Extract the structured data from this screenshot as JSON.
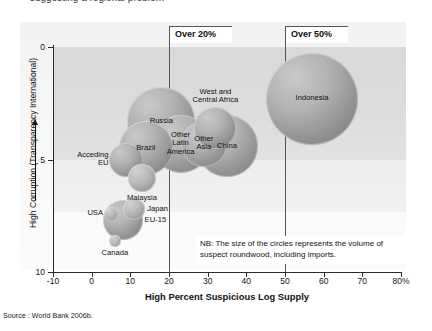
{
  "figure": {
    "source_note": "Source : World Bank 2006b.",
    "nb_note": "NB: The size of the circles represents the volume of suspect roundwood, including imports.",
    "clipped_top_text": "suggesting a regional problem"
  },
  "chart_data": {
    "type": "scatter",
    "title": "",
    "xlabel": "High Percent Suspicious Log Supply",
    "ylabel": "High Corruption (Transparency International)",
    "xlim": [
      -10,
      80
    ],
    "ylim": [
      0,
      10
    ],
    "y_inverted": true,
    "xticks": [
      "-10",
      "0",
      "10",
      "20",
      "30",
      "40",
      "50",
      "60",
      "70",
      "80%"
    ],
    "xtick_values": [
      -10,
      0,
      10,
      20,
      30,
      40,
      50,
      60,
      70,
      80
    ],
    "yticks": [
      "0",
      "5",
      "10"
    ],
    "ytick_values": [
      0,
      5,
      10
    ],
    "grid": false,
    "legend": "none",
    "size_meaning": "volume of suspect roundwood, including imports",
    "annotations": [
      {
        "label": "Over 20%",
        "x": 20
      },
      {
        "label": "Over 50%",
        "x": 50
      }
    ],
    "points": [
      {
        "name": "Indonesia",
        "x": 57,
        "y": 2.3,
        "size": 46,
        "label_pos": "in"
      },
      {
        "name": "West and\nCentral Africa",
        "x": 32,
        "y": 3.6,
        "size": 21,
        "label_pos": "above"
      },
      {
        "name": "Russia",
        "x": 18,
        "y": 3.3,
        "size": 34,
        "label_pos": "in"
      },
      {
        "name": "Other\nLatin\nAmerica",
        "x": 23,
        "y": 4.3,
        "size": 29,
        "label_pos": "in"
      },
      {
        "name": "Other\nAsia",
        "x": 29,
        "y": 4.3,
        "size": 23,
        "label_pos": "in"
      },
      {
        "name": "China",
        "x": 35,
        "y": 4.4,
        "size": 31,
        "label_pos": "in"
      },
      {
        "name": "Brazil",
        "x": 14,
        "y": 4.5,
        "size": 27,
        "label_pos": "in"
      },
      {
        "name": "Acceding\nEU",
        "x": 9,
        "y": 5.0,
        "size": 17,
        "label_pos": "left"
      },
      {
        "name": "Malaysia",
        "x": 13,
        "y": 5.8,
        "size": 14,
        "label_pos": "below"
      },
      {
        "name": "Japan",
        "x": 11,
        "y": 7.2,
        "size": 11,
        "label_pos": "right"
      },
      {
        "name": "EU-15",
        "x": 8,
        "y": 7.7,
        "size": 20,
        "label_pos": "right"
      },
      {
        "name": "USA",
        "x": 5,
        "y": 7.4,
        "size": 7,
        "label_pos": "left"
      },
      {
        "name": "Canada",
        "x": 6,
        "y": 8.6,
        "size": 6,
        "label_pos": "below"
      }
    ]
  },
  "colors": {
    "panel_light": "#f5f5f5",
    "panel_dark": "#dcdcdc",
    "bubble_fill": "#a8a8a8",
    "axis": "#2b2b2b",
    "text": "#111111"
  }
}
